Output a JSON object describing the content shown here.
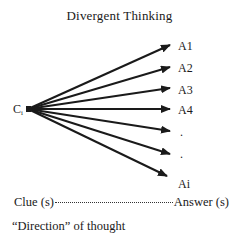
{
  "title": "Divergent Thinking",
  "origin": {
    "label": "C",
    "subscript": "i"
  },
  "answers": [
    {
      "label": "A1",
      "x": 178,
      "y": 40
    },
    {
      "label": "A2",
      "x": 178,
      "y": 62
    },
    {
      "label": "A3",
      "x": 178,
      "y": 84
    },
    {
      "label": "A4",
      "x": 178,
      "y": 104
    },
    {
      "label": ".",
      "x": 180,
      "y": 126
    },
    {
      "label": ".",
      "x": 180,
      "y": 148
    },
    {
      "label": "Ai",
      "x": 178,
      "y": 178
    }
  ],
  "arrows": [
    {
      "x1": 28,
      "y1": 109,
      "x2": 170,
      "y2": 45
    },
    {
      "x1": 28,
      "y1": 109,
      "x2": 170,
      "y2": 67
    },
    {
      "x1": 28,
      "y1": 109,
      "x2": 170,
      "y2": 88
    },
    {
      "x1": 28,
      "y1": 109,
      "x2": 170,
      "y2": 109
    },
    {
      "x1": 28,
      "y1": 109,
      "x2": 170,
      "y2": 131
    },
    {
      "x1": 28,
      "y1": 109,
      "x2": 170,
      "y2": 154
    },
    {
      "x1": 28,
      "y1": 109,
      "x2": 167,
      "y2": 176
    }
  ],
  "legend": {
    "clue_label": "Clue (s)",
    "answer_label": "Answer (s)",
    "direction_label": "“Direction” of thought"
  },
  "colors": {
    "stroke": "#1a1a1a",
    "background": "#ffffff"
  }
}
